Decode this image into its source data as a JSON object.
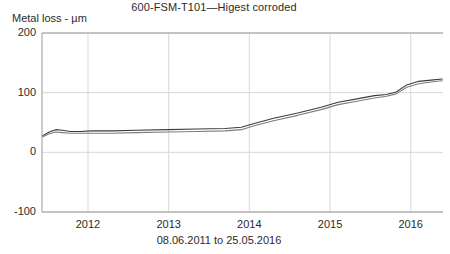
{
  "chart_data": {
    "type": "line",
    "title": "600-FSM-T101—Higest corroded",
    "xlabel": "08.06.2011 to 25.05.2016",
    "ylabel": "Metal loss - µm",
    "ylim": [
      -100,
      200
    ],
    "xlim": [
      2011.43,
      2016.4
    ],
    "yticks": [
      200,
      100,
      0,
      -100
    ],
    "ytick_labels": [
      "200",
      "100",
      "0",
      "-100"
    ],
    "xticks": [
      2012,
      2013,
      2014,
      2015,
      2016
    ],
    "xtick_labels": [
      "2012",
      "2013",
      "2014",
      "2015",
      "2016"
    ],
    "grid": true,
    "legend": "none",
    "series": [
      {
        "name": "sensor-a",
        "color": "#3c3c3c",
        "x": [
          2011.44,
          2011.52,
          2011.6,
          2011.68,
          2011.78,
          2011.9,
          2012.05,
          2012.3,
          2012.6,
          2013.0,
          2013.35,
          2013.7,
          2013.9,
          2014.05,
          2014.3,
          2014.6,
          2014.9,
          2015.1,
          2015.35,
          2015.55,
          2015.7,
          2015.82,
          2015.95,
          2016.1,
          2016.25,
          2016.39
        ],
        "y": [
          28,
          34,
          38,
          37,
          35,
          35,
          36,
          36,
          37,
          38,
          39,
          40,
          42,
          48,
          57,
          66,
          76,
          84,
          90,
          95,
          97,
          101,
          113,
          119,
          121,
          123
        ]
      },
      {
        "name": "sensor-b",
        "color": "#7d7d7d",
        "x": [
          2011.44,
          2011.52,
          2011.6,
          2011.68,
          2011.78,
          2011.9,
          2012.05,
          2012.3,
          2012.6,
          2013.0,
          2013.35,
          2013.7,
          2013.9,
          2014.05,
          2014.3,
          2014.6,
          2014.9,
          2015.1,
          2015.35,
          2015.55,
          2015.7,
          2015.82,
          2015.95,
          2016.1,
          2016.25,
          2016.39
        ],
        "y": [
          26,
          31,
          34,
          33,
          32,
          32,
          32,
          32,
          33,
          34,
          35,
          36,
          38,
          44,
          53,
          62,
          72,
          80,
          86,
          91,
          94,
          98,
          109,
          115,
          118,
          120
        ]
      }
    ],
    "axis_color": "#9a9a9a",
    "grid_color": "#d8d8d8"
  }
}
